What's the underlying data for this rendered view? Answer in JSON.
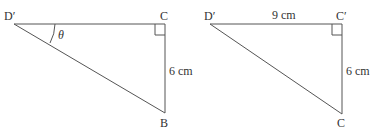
{
  "left_triangle": {
    "vertex_top_left": "D′",
    "vertex_top_right": "C",
    "vertex_bottom": "B",
    "side_right_label": "6 cm",
    "angle_label": "θ"
  },
  "right_triangle": {
    "vertex_top_left": "D′",
    "vertex_top_right": "C′",
    "vertex_bottom": "C",
    "side_top_label": "9 cm",
    "side_right_label": "6 cm"
  }
}
